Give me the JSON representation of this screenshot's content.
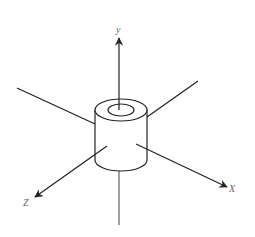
{
  "diagram": {
    "type": "3d-coordinate-axes-with-hollow-cylinder",
    "background": "#ffffff",
    "line_color": "#222222",
    "label_color": "#666666",
    "axes": {
      "y": {
        "label": "y",
        "from": [
          119,
          225
        ],
        "to": [
          119,
          38
        ],
        "label_pos": [
          119,
          33
        ]
      },
      "x": {
        "label": "X",
        "from": [
          136,
          144
        ],
        "to": [
          227,
          187
        ],
        "label_pos": [
          233,
          192
        ]
      },
      "z": {
        "label": "Z",
        "from": [
          107,
          146
        ],
        "to": [
          35,
          197
        ],
        "label_pos": [
          27,
          206
        ]
      },
      "back_left": {
        "from": [
          17,
          88
        ],
        "to": [
          95,
          124
        ]
      },
      "back_right": {
        "from": [
          198,
          81
        ],
        "to": [
          147,
          117
        ]
      }
    },
    "cylinder": {
      "center_top": [
        121,
        110
      ],
      "outer_rx": 26,
      "outer_ry": 11,
      "inner_rx": 13,
      "inner_ry": 6,
      "bottom_y": 160
    }
  }
}
